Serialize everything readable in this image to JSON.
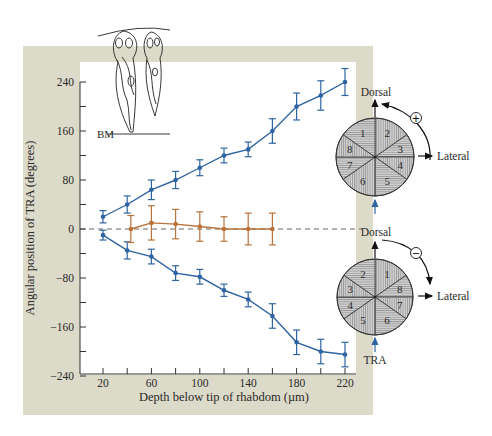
{
  "chart_data": {
    "type": "line",
    "title": "",
    "xlabel": "Depth below tip of rhabdom (µm)",
    "ylabel": "Angular position of TRA (degrees)",
    "xlim": [
      5,
      230
    ],
    "ylim": [
      -240,
      240
    ],
    "x_ticks": [
      20,
      60,
      100,
      140,
      180,
      220
    ],
    "x_minor_ticks": [
      20,
      40,
      60,
      80,
      100,
      120,
      140,
      160,
      180,
      200,
      220
    ],
    "y_ticks": [
      240,
      160,
      80,
      0,
      -80,
      -160,
      -240
    ],
    "y_minor_ticks": [
      240,
      200,
      160,
      120,
      80,
      40,
      0,
      -40,
      -80,
      -120,
      -160,
      -200,
      -240
    ],
    "grid": false,
    "zero_line": "dashed",
    "series": [
      {
        "name": "Clockwise-twisting (positive) rhabdoms",
        "color": "#2f64a2",
        "x": [
          20,
          40,
          60,
          80,
          100,
          120,
          140,
          160,
          180,
          200,
          220
        ],
        "values": [
          20,
          40,
          64,
          80,
          100,
          120,
          130,
          160,
          200,
          218,
          240
        ],
        "error": [
          10,
          14,
          16,
          14,
          13,
          12,
          12,
          20,
          22,
          24,
          22
        ]
      },
      {
        "name": "Counterclockwise-twisting (negative) rhabdoms",
        "color": "#2f64a2",
        "x": [
          20,
          40,
          60,
          80,
          100,
          120,
          140,
          160,
          180,
          200,
          220
        ],
        "values": [
          -10,
          -35,
          -45,
          -72,
          -78,
          -100,
          -115,
          -142,
          -185,
          -200,
          -205
        ],
        "error": [
          8,
          14,
          12,
          12,
          12,
          10,
          12,
          20,
          20,
          20,
          20
        ]
      },
      {
        "name": "Non-twisting rhabdoms",
        "color": "#b8733a",
        "x": [
          43,
          60,
          80,
          100,
          120,
          140,
          160
        ],
        "values": [
          0,
          10,
          8,
          4,
          0,
          0,
          0
        ],
        "error": [
          22,
          28,
          24,
          24,
          20,
          26,
          26
        ]
      }
    ],
    "annotations": [
      "BM",
      "Dorsal",
      "Lateral",
      "+",
      "Dorsal",
      "Lateral",
      "−",
      "TRA"
    ]
  },
  "axes": {
    "xlabel": "Depth below tip of rhabdom (µm)",
    "ylabel": "Angular position of TRA (degrees)",
    "x_tick_labels": [
      "20",
      "60",
      "100",
      "140",
      "180",
      "220"
    ],
    "y_tick_labels": [
      "240",
      "160",
      "80",
      "0",
      "−80",
      "−160",
      "−240"
    ]
  },
  "inset_cells": {
    "label": "BM"
  },
  "pinwheel_top": {
    "dorsal_label": "Dorsal",
    "lateral_label": "Lateral",
    "rotation_sign": "+",
    "sectors": [
      "1",
      "2",
      "3",
      "4",
      "5",
      "6",
      "7",
      "8"
    ]
  },
  "pinwheel_bottom": {
    "dorsal_label": "Dorsal",
    "lateral_label": "Lateral",
    "rotation_sign": "−",
    "sectors": [
      "2",
      "1",
      "8",
      "7",
      "6",
      "5",
      "4",
      "3"
    ],
    "tra_label": "TRA"
  },
  "colors": {
    "frame": "#dcdac8",
    "plot_bg": "#ffffff",
    "blue": "#2f64a2",
    "orange": "#b8733a",
    "pinwheel_fill": "#c9c9c9"
  }
}
